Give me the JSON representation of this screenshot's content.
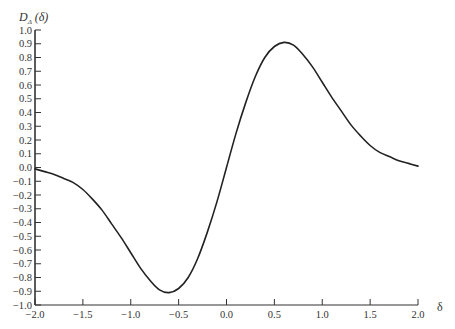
{
  "chart_data": {
    "type": "line",
    "title": "",
    "xlabel": "δ",
    "ylabel": "D_Δ (δ)",
    "ylabel_main": "D",
    "ylabel_sub": "Δ",
    "ylabel_arg": "(δ)",
    "xlim": [
      -2.0,
      2.0
    ],
    "ylim": [
      -1.0,
      1.0
    ],
    "grid": false,
    "legend": null,
    "x_ticks": [
      "-2.0",
      "-1.5",
      "-1.0",
      "-0.5",
      "0.0",
      "0.5",
      "1.0",
      "1.5",
      "2.0"
    ],
    "x_tick_values": [
      -2.0,
      -1.5,
      -1.0,
      -0.5,
      0.0,
      0.5,
      1.0,
      1.5,
      2.0
    ],
    "y_ticks": [
      "1.0",
      "0.9",
      "0.8",
      "0.7",
      "0.6",
      "0.5",
      "0.4",
      "0.3",
      "0.2",
      "0.1",
      "0.0",
      "-0.1",
      "-0.2",
      "-0.3",
      "-0.4",
      "-0.5",
      "-0.6",
      "-0.7",
      "-0.8",
      "-0.9",
      "-1.0"
    ],
    "y_tick_values": [
      1.0,
      0.9,
      0.8,
      0.7,
      0.6,
      0.5,
      0.4,
      0.3,
      0.2,
      0.1,
      0.0,
      -0.1,
      -0.2,
      -0.3,
      -0.4,
      -0.5,
      -0.6,
      -0.7,
      -0.8,
      -0.9,
      -1.0
    ],
    "series": [
      {
        "name": "D_Δ(δ)",
        "color": "#222222",
        "x": [
          -2.0,
          -1.9,
          -1.8,
          -1.7,
          -1.6,
          -1.5,
          -1.4,
          -1.3,
          -1.2,
          -1.1,
          -1.0,
          -0.9,
          -0.8,
          -0.7,
          -0.6,
          -0.5,
          -0.4,
          -0.3,
          -0.2,
          -0.1,
          0.0,
          0.1,
          0.2,
          0.3,
          0.4,
          0.5,
          0.6,
          0.7,
          0.8,
          0.9,
          1.0,
          1.1,
          1.2,
          1.3,
          1.4,
          1.5,
          1.6,
          1.7,
          1.8,
          1.9,
          2.0
        ],
        "y": [
          -0.01,
          -0.03,
          -0.05,
          -0.08,
          -0.11,
          -0.16,
          -0.23,
          -0.31,
          -0.41,
          -0.51,
          -0.62,
          -0.73,
          -0.82,
          -0.89,
          -0.91,
          -0.88,
          -0.8,
          -0.66,
          -0.47,
          -0.25,
          0.0,
          0.25,
          0.47,
          0.66,
          0.8,
          0.88,
          0.91,
          0.89,
          0.82,
          0.73,
          0.62,
          0.51,
          0.41,
          0.31,
          0.23,
          0.16,
          0.11,
          0.08,
          0.05,
          0.03,
          0.01
        ]
      }
    ]
  }
}
